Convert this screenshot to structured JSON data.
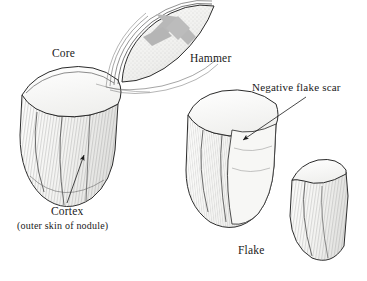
{
  "figure": {
    "background_color": "#ffffff",
    "ink_color": "#1a1a1a",
    "stone_fill": "#fbfbfa",
    "shade_gray": "#b9b9b9",
    "hatch_color": "#6e6e6e"
  },
  "labels": {
    "core": "Core",
    "hammer": "Hammer",
    "negative_flake_scar": "Negative flake scar",
    "flake": "Flake",
    "cortex": "Cortex",
    "cortex_note": "(outer skin of nodule)"
  },
  "objects": [
    {
      "name": "core",
      "label": "Core",
      "description": "Stone nodule with flat striking platform at top and hatched cortex surface"
    },
    {
      "name": "hammer",
      "label": "Hammer",
      "description": "Elongated hammerstone shown in motion with trailing arcs and an internal gray motion arrow"
    },
    {
      "name": "struck-core",
      "label": "Negative flake scar",
      "description": "Core after detachment showing the concave negative flake scar"
    },
    {
      "name": "flake",
      "label": "Flake",
      "description": "Detached flake with hatched dorsal surface"
    }
  ],
  "annotations": [
    {
      "name": "cortex-leader",
      "points_to": "Cortex",
      "arrow": "up",
      "description": "Leader line from the Cortex label up to an arrowhead on the core surface"
    },
    {
      "name": "scar-leader",
      "points_to": "Negative flake scar",
      "arrow": "down-left",
      "description": "Leader line from the Negative flake scar label down-left to the scar on the struck core"
    },
    {
      "name": "hammer-motion-arrow",
      "points_to": "Hammer",
      "arrow": "down-left",
      "description": "Gray block arrow inside the hammerstone indicating striking direction"
    }
  ]
}
